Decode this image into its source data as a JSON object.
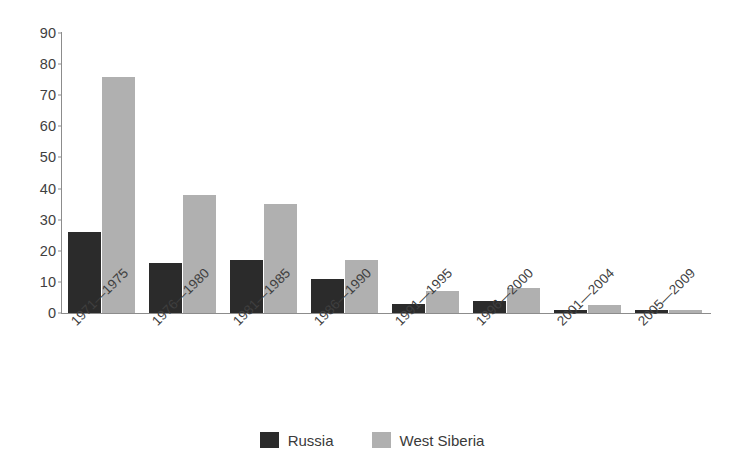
{
  "chart_data": {
    "type": "bar",
    "title": "",
    "subtitle": "",
    "xlabel": "",
    "ylabel": "",
    "ylim": [
      0,
      90
    ],
    "ytick_step": 10,
    "yticks": [
      0,
      10,
      20,
      30,
      40,
      50,
      60,
      70,
      80,
      90
    ],
    "grid": false,
    "legend_position": "bottom-center",
    "categories": [
      "1971—1975",
      "1976—1980",
      "1981—1985",
      "1986—1990",
      "1991—1995",
      "1996—2000",
      "2001—2004",
      "2005—2009"
    ],
    "series": [
      {
        "name": "Russia",
        "color": "#2b2b2b",
        "values": [
          26,
          16,
          17,
          11,
          3,
          4,
          1,
          1
        ]
      },
      {
        "name": "West Siberia",
        "color": "#b0b0b0",
        "values": [
          76,
          38,
          35,
          17,
          7,
          8,
          2.5,
          1
        ]
      }
    ],
    "annotations": []
  },
  "legend": {
    "items": [
      {
        "label": "Russia",
        "color": "#2b2b2b"
      },
      {
        "label": "West Siberia",
        "color": "#b0b0b0"
      }
    ]
  },
  "axis": {
    "y_tick_labels": [
      "90",
      "80",
      "70",
      "60",
      "50",
      "40",
      "30",
      "20",
      "10",
      "0"
    ]
  }
}
